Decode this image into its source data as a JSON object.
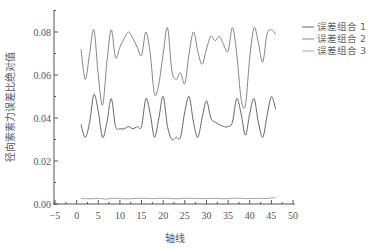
{
  "chart_data": {
    "type": "line",
    "title": "",
    "xlabel": "轴线",
    "ylabel": "径向索索力误差比绝对值",
    "xlim": [
      -5,
      50
    ],
    "ylim": [
      0,
      0.09
    ],
    "xticks": [
      -5,
      0,
      5,
      10,
      15,
      20,
      25,
      30,
      35,
      40,
      45,
      50
    ],
    "yticks": [
      0.0,
      0.02,
      0.04,
      0.06,
      0.08
    ],
    "ytick_labels": [
      "0.00",
      "0.02",
      "0.04",
      "0.06",
      "0.08"
    ],
    "grid": false,
    "legend_position": "upper right, outside plot",
    "x": [
      1,
      2,
      3,
      4,
      5,
      6,
      7,
      8,
      9,
      10,
      11,
      12,
      13,
      14,
      15,
      16,
      17,
      18,
      19,
      20,
      21,
      22,
      23,
      24,
      25,
      26,
      27,
      28,
      29,
      30,
      31,
      32,
      33,
      34,
      35,
      36,
      37,
      38,
      39,
      40,
      41,
      42,
      43,
      44,
      45,
      46
    ],
    "series": [
      {
        "name": "误差组合 1",
        "color": "#555555",
        "values": [
          0.037,
          0.031,
          0.038,
          0.051,
          0.043,
          0.031,
          0.038,
          0.049,
          0.036,
          0.035,
          0.035,
          0.036,
          0.035,
          0.036,
          0.036,
          0.049,
          0.042,
          0.031,
          0.04,
          0.05,
          0.036,
          0.03,
          0.031,
          0.031,
          0.043,
          0.05,
          0.038,
          0.031,
          0.04,
          0.048,
          0.04,
          0.038,
          0.037,
          0.036,
          0.036,
          0.038,
          0.049,
          0.042,
          0.032,
          0.042,
          0.049,
          0.038,
          0.031,
          0.041,
          0.05,
          0.044
        ]
      },
      {
        "name": "误差组合 2",
        "color": "#777777",
        "values": [
          0.072,
          0.058,
          0.07,
          0.081,
          0.06,
          0.046,
          0.066,
          0.081,
          0.068,
          0.073,
          0.077,
          0.08,
          0.077,
          0.073,
          0.069,
          0.08,
          0.07,
          0.051,
          0.056,
          0.07,
          0.082,
          0.062,
          0.058,
          0.061,
          0.056,
          0.07,
          0.08,
          0.071,
          0.065,
          0.072,
          0.078,
          0.076,
          0.078,
          0.074,
          0.071,
          0.082,
          0.07,
          0.049,
          0.046,
          0.068,
          0.082,
          0.075,
          0.066,
          0.079,
          0.081,
          0.079
        ]
      },
      {
        "name": "误差组合 3",
        "color": "#999999",
        "values": [
          0.0025,
          0.0025,
          0.0024,
          0.0025,
          0.0026,
          0.0024,
          0.0023,
          0.0026,
          0.0027,
          0.0025,
          0.0024,
          0.0024,
          0.0025,
          0.0026,
          0.0027,
          0.0026,
          0.0025,
          0.0025,
          0.0026,
          0.0027,
          0.0026,
          0.0025,
          0.0024,
          0.0025,
          0.0026,
          0.0027,
          0.0026,
          0.0025,
          0.0025,
          0.0025,
          0.0026,
          0.0026,
          0.0025,
          0.0024,
          0.0025,
          0.0026,
          0.0027,
          0.0026,
          0.0025,
          0.0025,
          0.0026,
          0.0026,
          0.0025,
          0.0026,
          0.0028,
          0.003
        ]
      }
    ]
  },
  "legend": {
    "items": [
      {
        "label": "误差组合 1",
        "color": "#555555"
      },
      {
        "label": "误差组合 2",
        "color": "#777777"
      },
      {
        "label": "误差组合 3",
        "color": "#999999"
      }
    ]
  }
}
